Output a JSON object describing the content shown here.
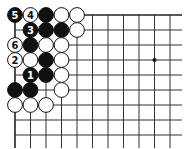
{
  "board": {
    "grid": {
      "x0": 15,
      "y0": 15,
      "dx": 15.5,
      "dy": 15,
      "cols": 11,
      "rows": 9,
      "right_edge": 182,
      "bottom_edge": 148
    },
    "star_points": [
      {
        "col": 9,
        "row": 3
      }
    ],
    "colors": {
      "black": "#111111",
      "white": "#ffffff",
      "line": "#333333"
    },
    "stones": [
      {
        "col": 0,
        "row": 0,
        "color": "black",
        "label": "5"
      },
      {
        "col": 1,
        "row": 0,
        "color": "white",
        "label": "4"
      },
      {
        "col": 2,
        "row": 0,
        "color": "black",
        "label": ""
      },
      {
        "col": 3,
        "row": 0,
        "color": "white",
        "label": ""
      },
      {
        "col": 4,
        "row": 0,
        "color": "white",
        "label": ""
      },
      {
        "col": 1,
        "row": 1,
        "color": "black",
        "label": "3"
      },
      {
        "col": 2,
        "row": 1,
        "color": "black",
        "label": ""
      },
      {
        "col": 3,
        "row": 1,
        "color": "black",
        "label": ""
      },
      {
        "col": 4,
        "row": 1,
        "color": "white",
        "label": ""
      },
      {
        "col": 0,
        "row": 2,
        "color": "white",
        "label": "6"
      },
      {
        "col": 1,
        "row": 2,
        "color": "black",
        "label": ""
      },
      {
        "col": 2,
        "row": 2,
        "color": "white",
        "label": ""
      },
      {
        "col": 3,
        "row": 2,
        "color": "white",
        "label": ""
      },
      {
        "col": 0,
        "row": 3,
        "color": "white",
        "label": "2"
      },
      {
        "col": 1,
        "row": 3,
        "color": "white",
        "label": ""
      },
      {
        "col": 2,
        "row": 3,
        "color": "black",
        "label": ""
      },
      {
        "col": 3,
        "row": 3,
        "color": "white",
        "label": ""
      },
      {
        "col": 1,
        "row": 4,
        "color": "black",
        "label": "1"
      },
      {
        "col": 2,
        "row": 4,
        "color": "black",
        "label": ""
      },
      {
        "col": 3,
        "row": 4,
        "color": "white",
        "label": ""
      },
      {
        "col": 0,
        "row": 5,
        "color": "black",
        "label": ""
      },
      {
        "col": 1,
        "row": 5,
        "color": "black",
        "label": ""
      },
      {
        "col": 3,
        "row": 5,
        "color": "white",
        "label": ""
      },
      {
        "col": 0,
        "row": 6,
        "color": "white",
        "label": ""
      },
      {
        "col": 1,
        "row": 6,
        "color": "white",
        "label": ""
      },
      {
        "col": 2,
        "row": 6,
        "color": "white",
        "label": ""
      }
    ]
  }
}
